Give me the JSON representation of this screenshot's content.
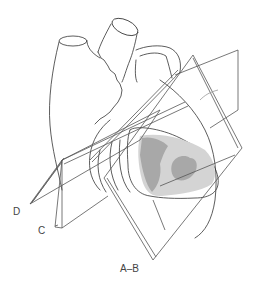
{
  "diagram": {
    "labels": {
      "plane_d": "D",
      "plane_c": "C",
      "plane_ab": "A–B"
    },
    "colors": {
      "line": "#333333",
      "plane_line": "#555555",
      "shade_light": "#d4d4d4",
      "shade_dark": "#a8a8a8",
      "background": "#ffffff"
    }
  }
}
